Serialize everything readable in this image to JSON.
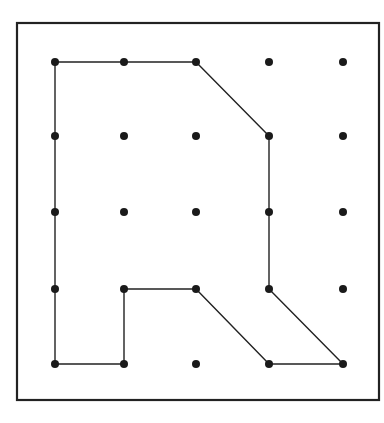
{
  "diagram": {
    "type": "geoboard",
    "frame": {
      "x": 17,
      "y": 23,
      "width": 362,
      "height": 377,
      "stroke": "#222222",
      "stroke_width": 2.2
    },
    "grid": {
      "columns": 5,
      "rows": 5,
      "x_positions": [
        55,
        124,
        196,
        269,
        343
      ],
      "y_positions": [
        62,
        136,
        212,
        289,
        364
      ],
      "dot_radius": 4,
      "dot_color": "#1a1a1a"
    },
    "polygon": {
      "stroke": "#222222",
      "stroke_width": 1.4,
      "vertices_grid": [
        [
          0,
          0
        ],
        [
          1,
          0
        ],
        [
          2,
          0
        ],
        [
          3,
          1
        ],
        [
          3,
          2
        ],
        [
          3,
          3
        ],
        [
          4,
          4
        ],
        [
          3,
          4
        ],
        [
          2,
          3
        ],
        [
          1,
          3
        ],
        [
          1,
          4
        ],
        [
          0,
          4
        ],
        [
          0,
          3
        ],
        [
          0,
          2
        ],
        [
          0,
          1
        ]
      ]
    }
  }
}
